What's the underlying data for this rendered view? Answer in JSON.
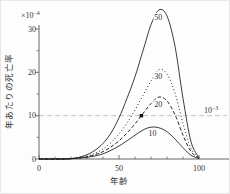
{
  "figure": {
    "background": "#fdfdfd",
    "axis_color": "#555555",
    "text_color": "#333333",
    "curve_color": "#1a1a1a",
    "ref_line_color": "#b4b4b4",
    "marker_color": "#111111"
  },
  "chart_data": {
    "type": "line",
    "title": "",
    "xlabel": "年齢",
    "ylabel": "年あたりの死亡率",
    "y_scale_factor": {
      "base": "×10",
      "exp": "−4"
    },
    "xlim": [
      0,
      100
    ],
    "ylim": [
      0,
      30
    ],
    "x_major_ticks": [
      0,
      50,
      100
    ],
    "x_tick_labels": [
      "0",
      "50",
      "100"
    ],
    "x_minor_step": 10,
    "y_major_ticks": [
      0,
      10,
      20,
      30
    ],
    "y_tick_labels": [
      "0",
      "10",
      "20",
      "30"
    ],
    "y_minor_ticks": [
      5,
      15,
      25
    ],
    "grid": false,
    "legend": "labels drawn at curve peaks",
    "x": [
      0,
      5,
      10,
      15,
      20,
      25,
      30,
      35,
      40,
      45,
      50,
      55,
      60,
      65,
      70,
      75,
      80,
      85,
      90,
      95,
      100
    ],
    "series": [
      {
        "name": "50",
        "style": "solid",
        "values": [
          0,
          0,
          0,
          0,
          0.1,
          0.4,
          1.0,
          2.0,
          3.6,
          6.0,
          9.5,
          14,
          19,
          25,
          31,
          34.4,
          33,
          26,
          14,
          4,
          0.3
        ],
        "label": {
          "x": 74.5,
          "y": 32.6,
          "text": "50"
        }
      },
      {
        "name": "30",
        "style": "dotted",
        "values": [
          0,
          0,
          0,
          0,
          0.1,
          0.3,
          0.7,
          1.3,
          2.3,
          3.8,
          5.8,
          8.3,
          11.3,
          14.7,
          18,
          20.6,
          19.6,
          15.2,
          8.2,
          2.4,
          0.2
        ],
        "label": {
          "x": 74.5,
          "y": 19.0,
          "text": "30"
        }
      },
      {
        "name": "20",
        "style": "dashed",
        "values": [
          0,
          0,
          0,
          0,
          0.1,
          0.2,
          0.5,
          1.0,
          1.7,
          2.8,
          4.2,
          6.0,
          8.1,
          10.5,
          12.8,
          14.3,
          13.4,
          10.2,
          5.5,
          1.7,
          0.15
        ],
        "label": {
          "x": 74.5,
          "y": 12.6,
          "text": "20"
        }
      },
      {
        "name": "10",
        "style": "solid",
        "values": [
          0,
          0,
          0,
          0,
          0.05,
          0.2,
          0.4,
          0.7,
          1.2,
          2.0,
          3.0,
          4.2,
          5.5,
          6.7,
          7.35,
          7.2,
          6.3,
          4.6,
          2.6,
          0.85,
          0.1
        ],
        "label": {
          "x": 71,
          "y": 5.85,
          "text": "10"
        }
      }
    ],
    "reference_line": {
      "y": 10,
      "style": "dashed",
      "label": {
        "base": "10",
        "exp": "−3"
      }
    },
    "marker": {
      "x": 64,
      "y": 10,
      "shape": "filled-square",
      "note": "intersection of curve 20 with reference line"
    }
  }
}
